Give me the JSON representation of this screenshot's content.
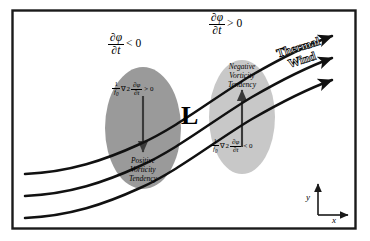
{
  "figure": {
    "background_color": "#ffffff",
    "frame_color": "#1a1a1a"
  },
  "low_center": {
    "label": "L",
    "meaning": "surface low pressure center"
  },
  "thermal_wind": {
    "line1": "Thermal",
    "line2": "Wind",
    "arrow_count": 3,
    "direction": "eastward"
  },
  "regions": [
    {
      "id": "left-region",
      "name": "positive-vorticity-tendency-region",
      "fill_color": "#9a9a9a",
      "tendency_annotation": {
        "numerator": "∂φ",
        "denominator": "∂t",
        "relation": "< 0"
      },
      "inner_equation": {
        "coef_num": "1",
        "coef_den": "f",
        "coef_den_sub": "0",
        "laplacian": "∇2",
        "numerator": "∂φ",
        "denominator": "∂t",
        "relation": "> 0"
      },
      "vorticity_label": [
        "Positive",
        "Vorticity",
        "Tendency"
      ],
      "arrow_direction": "down"
    },
    {
      "id": "right-region",
      "name": "negative-vorticity-tendency-region",
      "fill_color": "#c8c8c8",
      "tendency_annotation": {
        "numerator": "∂φ",
        "denominator": "∂t",
        "relation": "> 0"
      },
      "inner_equation": {
        "coef_num": "1",
        "coef_den": "f",
        "coef_den_sub": "0",
        "laplacian": "∇2",
        "numerator": "∂φ",
        "denominator": "∂t",
        "relation": "< 0"
      },
      "vorticity_label": [
        "Negative",
        "Vorticity",
        "Tendency"
      ],
      "arrow_direction": "up"
    }
  ],
  "axis_key": {
    "x_label": "x",
    "y_label": "y"
  }
}
